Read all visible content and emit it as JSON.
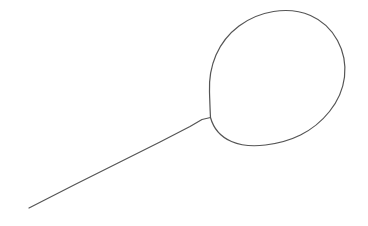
{
  "canvas": {
    "width": 368,
    "height": 226,
    "background_color": "#ffffff",
    "title": "Line drawing sketch"
  },
  "drawing": {
    "name": "balloon-sketch",
    "description": "Hand-drawn outline: a large circle with a straight diagonal line extending from its lower-left toward the bottom-left corner",
    "stroke_color": "#555555",
    "stroke_width": 1.2,
    "shapes": [
      {
        "name": "circle-outline",
        "type": "circle",
        "center_x": 278,
        "center_y": 78,
        "radius": 66,
        "stroke_color": "#555555",
        "stroke_width": 1.2,
        "fill": "none",
        "path": "M 210.5 117.5 C 213.5 128.5 221.0 137.0 231.5 141.5 C 242.0 146.0 254.0 146.5 265.5 145.0 C 277.5 143.5 289.5 140.5 300.5 135.0 C 311.5 129.5 321.5 121.5 329.5 111.5 C 337.5 101.5 343.0 89.5 344.5 77.0 C 346.0 64.5 343.5 51.5 337.5 40.5 C 331.5 29.5 322.0 20.5 310.5 15.5 C 299.0 10.5 286.0 9.5 273.5 11.5 C 261.0 13.5 249.0 18.5 239.0 26.0 C 229.0 33.5 221.0 43.5 216.0 55.0 C 211.0 66.5 209.0 79.5 209.5 92.0 C 209.8 100.5 210.0 109.0 210.5 117.5 Z"
      },
      {
        "name": "tail-line",
        "type": "polyline",
        "start_x": 29,
        "start_y": 208,
        "end_x": 210,
        "end_y": 117,
        "apex_x": 207,
        "apex_y": 117,
        "stroke_color": "#555555",
        "stroke_width": 1.2,
        "fill": "none",
        "path": "M 29.0 208.0 L 75.0 184.5 L 120.0 162.0 L 160.0 142.0 L 190.0 126.5 L 202.0 119.5 L 210.5 117.5"
      }
    ]
  }
}
